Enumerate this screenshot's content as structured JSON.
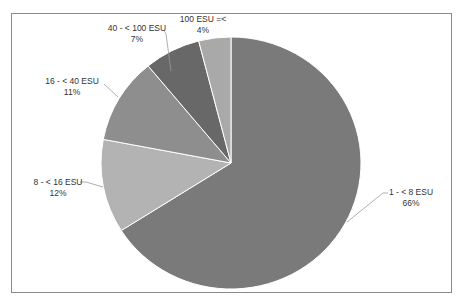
{
  "chart_data": {
    "type": "pie",
    "title": "",
    "start_angle_deg": 0,
    "direction": "clockwise",
    "legend": "none",
    "slices": [
      {
        "label": "1 - < 8 ESU",
        "value": 66,
        "display": "66%",
        "color": "#7a7a7a"
      },
      {
        "label": "8 - < 16 ESU",
        "value": 12,
        "display": "12%",
        "color": "#b3b3b3"
      },
      {
        "label": "16 - < 40 ESU",
        "value": 11,
        "display": "11%",
        "color": "#8e8e8e"
      },
      {
        "label": "40 - < 100 ESU",
        "value": 7,
        "display": "7%",
        "color": "#686868"
      },
      {
        "label": "100 ESU =<",
        "value": 4,
        "display": "4%",
        "color": "#a9a9a9"
      }
    ]
  },
  "labels": {
    "s0": {
      "name": "1 - < 8 ESU",
      "pct": "66%"
    },
    "s1": {
      "name": "8 - < 16 ESU",
      "pct": "12%"
    },
    "s2": {
      "name": "16 - < 40 ESU",
      "pct": "11%"
    },
    "s3": {
      "name": "40 - < 100 ESU",
      "pct": "7%"
    },
    "s4": {
      "name": "100 ESU =<",
      "pct": "4%"
    }
  }
}
